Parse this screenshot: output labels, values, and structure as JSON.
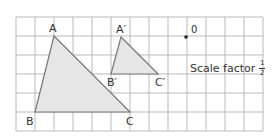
{
  "diagram": {
    "grid": {
      "x0": 16,
      "y0": 17,
      "cell": 19,
      "cols": 13,
      "rows": 6,
      "line_color": "#b9b9b9"
    },
    "triangle_large": {
      "fill": "#e6e6e6",
      "stroke": "#777777",
      "points": {
        "A": [
          54,
          36
        ],
        "B": [
          35,
          112
        ],
        "C": [
          130,
          112
        ]
      }
    },
    "triangle_small": {
      "fill": "#e6e6e6",
      "stroke": "#777777",
      "points": {
        "A'": [
          121,
          37
        ],
        "B'": [
          111,
          74
        ],
        "C'": [
          158,
          74
        ]
      }
    },
    "center": {
      "label": "0",
      "point": [
        186,
        37
      ]
    },
    "labels": {
      "A": "A",
      "B": "B",
      "C": "C",
      "A_prime": "A′",
      "B_prime": "B′",
      "C_prime": "C′",
      "O": "0"
    },
    "scale_factor": {
      "text": "Scale factor",
      "numerator": "1",
      "denominator": "2"
    }
  }
}
